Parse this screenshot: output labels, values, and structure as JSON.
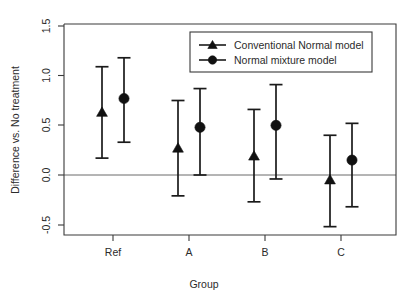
{
  "chart_data": {
    "type": "scatter",
    "title": "",
    "xlabel": "Group",
    "ylabel": "Difference vs. No treatment",
    "categories": [
      "Ref",
      "A",
      "B",
      "C"
    ],
    "xtick_labels": [
      "Ref",
      "A",
      "B",
      "C"
    ],
    "ytick_labels": [
      "-0.5",
      "0.0",
      "0.5",
      "1.0",
      "1.5"
    ],
    "ytick_values": [
      -0.5,
      0.0,
      0.5,
      1.0,
      1.5
    ],
    "ylim": [
      -0.62,
      1.57
    ],
    "grid": false,
    "reference_line": 0.0,
    "legend_position": "top-right",
    "series": [
      {
        "name": "Conventional Normal model",
        "marker": "triangle",
        "values": [
          0.63,
          0.27,
          0.19,
          -0.05
        ],
        "lower": [
          0.17,
          -0.21,
          -0.27,
          -0.52
        ],
        "upper": [
          1.09,
          0.75,
          0.66,
          0.4
        ]
      },
      {
        "name": "Normal mixture model",
        "marker": "circle",
        "values": [
          0.77,
          0.48,
          0.5,
          0.15
        ],
        "lower": [
          0.33,
          0.0,
          -0.04,
          -0.32
        ],
        "upper": [
          1.18,
          0.87,
          0.91,
          0.52
        ]
      }
    ],
    "colors": {
      "marker": "#111111",
      "errorbar": "#1a1a1a",
      "axis": "#3a3a3a",
      "zero_line": "#6a6a6a",
      "background": "#ffffff"
    }
  },
  "legend": {
    "items": [
      {
        "label": "Conventional Normal model",
        "icon": "triangle-marker-icon"
      },
      {
        "label": "Normal mixture model",
        "icon": "circle-marker-icon"
      }
    ]
  },
  "axes": {
    "x_title": "Group",
    "y_title": "Difference vs. No treatment",
    "x_labels": [
      "Ref",
      "A",
      "B",
      "C"
    ],
    "y_labels": [
      "1.5",
      "1.0",
      "0.5",
      "0.0",
      "-0.5"
    ]
  }
}
